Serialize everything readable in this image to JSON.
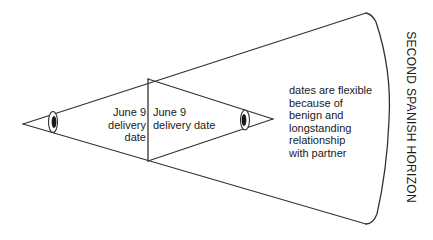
{
  "diagram": {
    "labels": {
      "left_section": "June 9\ndelivery date",
      "middle_section": "June 9\ndelivery date",
      "right_section": "dates are flexible\nbecause of\nbenign and\nlongstanding\nrelationship\nwith partner",
      "horizon": "SECOND SPANISH HORIZON"
    },
    "elements": {
      "left_eye": "eye-icon",
      "right_eye": "eye-icon"
    },
    "colors": {
      "stroke": "#333333",
      "background": "#ffffff"
    }
  }
}
